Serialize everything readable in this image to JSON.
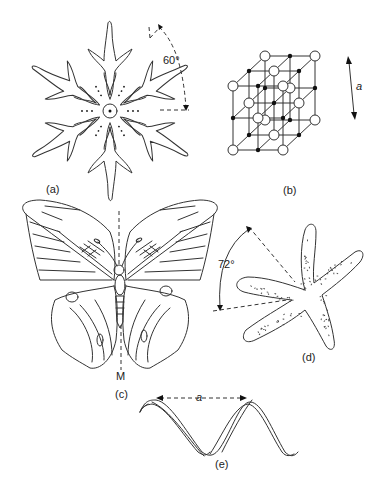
{
  "figure": {
    "panels": [
      {
        "id": "a",
        "label": "(a)",
        "subject": "snowflake",
        "annotation": "60°"
      },
      {
        "id": "b",
        "label": "(b)",
        "subject": "crystal lattice",
        "annotation": "a"
      },
      {
        "id": "c",
        "label": "(c)",
        "subject": "butterfly",
        "annotation": "M"
      },
      {
        "id": "d",
        "label": "(d)",
        "subject": "starfish",
        "annotation": "72°"
      },
      {
        "id": "e",
        "label": "(e)",
        "subject": "helical ribbon",
        "annotation": "a"
      }
    ]
  },
  "colors": {
    "stroke": "#333333",
    "background": "#ffffff"
  }
}
